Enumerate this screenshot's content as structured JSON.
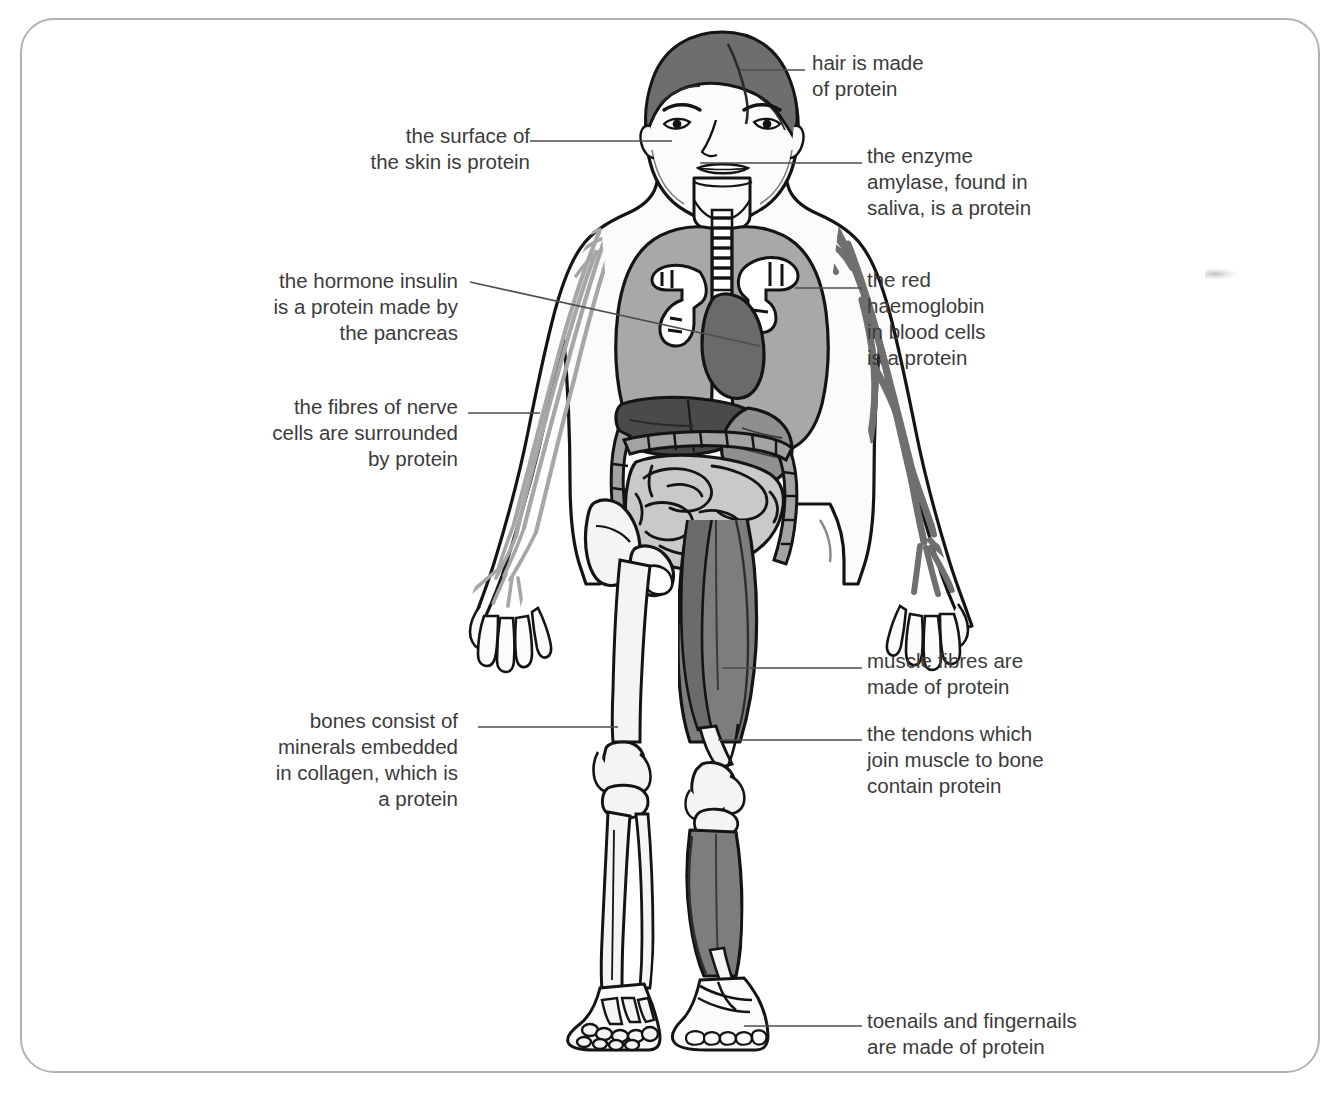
{
  "figure": {
    "frame_color": "#b3b3b3",
    "background_color": "#ffffff"
  },
  "palette": {
    "outline": "#141414",
    "hair": "#6e6e6e",
    "skin_fill": "#fbfbfb",
    "lung": "#a8a8a8",
    "heart": "#6a6a6a",
    "liver": "#4a4a4a",
    "stomach": "#8f8f8f",
    "intestine": "#c9c9c9",
    "intestine_frame": "#a3a3a3",
    "muscle": "#7d7d7d",
    "bone": "#f4f4f4",
    "vein": "#6f6f6f",
    "nerve": "#a6a6a6",
    "leader_line": "#4d4d4d",
    "text": "#3b3b3b"
  },
  "callouts": [
    {
      "id": "hair",
      "name": "callout-hair",
      "lines": [
        "hair is made",
        "of protein"
      ],
      "align": "left",
      "target": "hair"
    },
    {
      "id": "skin",
      "name": "callout-skin",
      "lines": [
        "the surface of",
        "the skin is protein"
      ],
      "align": "right",
      "target": "cheek-skin"
    },
    {
      "id": "amylase",
      "name": "callout-amylase",
      "lines": [
        "the enzyme",
        "amylase, found in",
        "saliva, is a protein"
      ],
      "align": "left",
      "target": "mouth-saliva"
    },
    {
      "id": "insulin",
      "name": "callout-insulin",
      "lines": [
        "the hormone insulin",
        "is a protein made by",
        "the pancreas"
      ],
      "align": "right",
      "target": "pancreas"
    },
    {
      "id": "haemoglobin",
      "name": "callout-haemoglobin",
      "lines": [
        "the red",
        "haemoglobin",
        "in blood cells",
        "is a protein"
      ],
      "align": "left",
      "target": "blood-vessel-arm"
    },
    {
      "id": "nerve",
      "name": "callout-nerve",
      "lines": [
        "the fibres of nerve",
        "cells are surrounded",
        "by protein"
      ],
      "align": "right",
      "target": "nerve-fibres-arm"
    },
    {
      "id": "muscle",
      "name": "callout-muscle",
      "lines": [
        "muscle fibres are",
        "made of protein"
      ],
      "align": "left",
      "target": "thigh-muscle"
    },
    {
      "id": "bones",
      "name": "callout-bones",
      "lines": [
        "bones consist of",
        "minerals embedded",
        "in collagen, which is",
        "a protein"
      ],
      "align": "right",
      "target": "femur-bone"
    },
    {
      "id": "tendons",
      "name": "callout-tendons",
      "lines": [
        "the tendons which",
        "join muscle to bone",
        "contain protein"
      ],
      "align": "left",
      "target": "knee-tendon"
    },
    {
      "id": "nails",
      "name": "callout-nails",
      "lines": [
        "toenails and fingernails",
        "are made of protein"
      ],
      "align": "left",
      "target": "toenails"
    }
  ],
  "body_parts": [
    {
      "name": "hair",
      "label": "hair"
    },
    {
      "name": "face",
      "label": "face"
    },
    {
      "name": "trachea",
      "label": "trachea"
    },
    {
      "name": "lungs",
      "label": "lungs"
    },
    {
      "name": "heart",
      "label": "heart"
    },
    {
      "name": "liver",
      "label": "liver"
    },
    {
      "name": "stomach",
      "label": "stomach"
    },
    {
      "name": "intestines",
      "label": "intestines"
    },
    {
      "name": "pelvis",
      "label": "pelvis"
    },
    {
      "name": "leg-bones",
      "label": "leg bones"
    },
    {
      "name": "leg-muscles",
      "label": "leg muscles"
    },
    {
      "name": "arm-nerves",
      "label": "arm nerves"
    },
    {
      "name": "arm-veins",
      "label": "arm blood vessels"
    },
    {
      "name": "foot-bones",
      "label": "foot bones"
    },
    {
      "name": "toenails",
      "label": "toenails"
    }
  ]
}
